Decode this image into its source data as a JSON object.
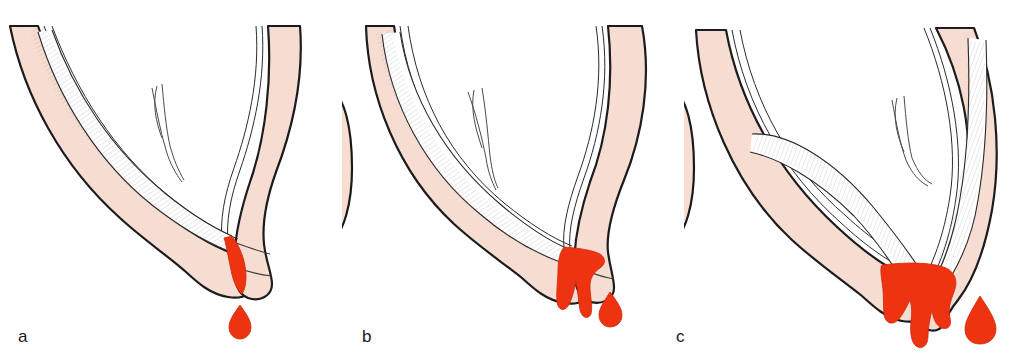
{
  "figure": {
    "background_color": "#ffffff",
    "width": 1027,
    "height": 359,
    "panel_count": 3
  },
  "palette": {
    "myometrium_wall": "#f8ddd2",
    "wall_outline": "#1a1a1a",
    "endometrium_fill": "#ffffff",
    "endometrium_hatch": "#9a9a9a",
    "blood": "#ee3311",
    "blood_outline": "#cc2a0d",
    "canal_line": "#3a3a3a",
    "label_color": "#1a1a1a",
    "page_background": "#ffffff"
  },
  "panels": [
    {
      "id": "a",
      "label": "a",
      "severity": "slight",
      "description": "Anteverted uterus in sagittal section with a thin trickle of blood at the external cervical os and a single falling drop",
      "blood_stream": "thin",
      "blood_drops": 1,
      "blood_mass_lobes": 1
    },
    {
      "id": "b",
      "label": "b",
      "severity": "moderate",
      "description": "Anteverted uterus in sagittal section with a broader blood mass at the cervical os forming two drip lobes and one detached drop",
      "blood_stream": "moderate",
      "blood_drops": 1,
      "blood_mass_lobes": 2
    },
    {
      "id": "c",
      "label": "c",
      "severity": "heavy",
      "description": "Uterus in sagittal section with a large bulging blood mass filling the cervical os, three drip lobes and one large detached drop",
      "blood_stream": "heavy",
      "blood_drops": 1,
      "blood_mass_lobes": 3
    }
  ],
  "anatomy": {
    "structures": [
      "myometrium",
      "endometrial cavity",
      "cervix",
      "external cervical os",
      "round ligament / tubal strand",
      "vaginal fornix"
    ]
  }
}
